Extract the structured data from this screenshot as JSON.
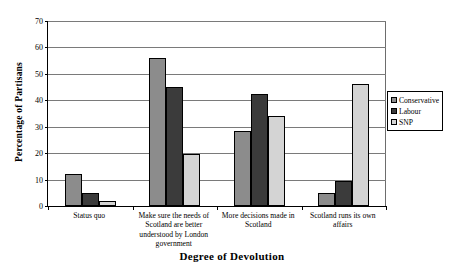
{
  "chart_data": {
    "type": "bar",
    "title": "",
    "xlabel": "Degree of Devolution",
    "ylabel": "Percentage of Partisans",
    "ylim": [
      0,
      70
    ],
    "yticks": [
      0,
      10,
      20,
      30,
      40,
      50,
      60,
      70
    ],
    "grid": true,
    "legend_position": "right",
    "categories": [
      "Status quo",
      "Make sure the needs of Scotland are better understood by London government",
      "More decisions made in Scotland",
      "Scotland runs its own affairs"
    ],
    "series": [
      {
        "name": "Conservative",
        "color": "#8c8c8c",
        "values": [
          12,
          56,
          28.5,
          5
        ]
      },
      {
        "name": "Labour",
        "color": "#3b3b3b",
        "values": [
          5,
          45,
          42.5,
          9.5
        ]
      },
      {
        "name": "SNP",
        "color": "#d4d4d4",
        "values": [
          2,
          19.5,
          34,
          46
        ]
      }
    ]
  },
  "axis": {
    "y_title": "Percentage of Partisans",
    "x_title": "Degree of Devolution",
    "y_tick_labels": [
      "70",
      "60",
      "50",
      "40",
      "30",
      "20",
      "10",
      "0"
    ]
  },
  "legend": {
    "items": [
      {
        "label": "Conservative",
        "color": "#8c8c8c"
      },
      {
        "label": "Labour",
        "color": "#3b3b3b"
      },
      {
        "label": "SNP",
        "color": "#d4d4d4"
      }
    ]
  },
  "category_labels": [
    "Status quo",
    "Make sure the needs of Scotland are better understood by London government",
    "More decisions made in Scotland",
    "Scotland runs its own affairs"
  ]
}
